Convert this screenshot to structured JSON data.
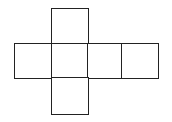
{
  "diagram": {
    "type": "cube-net",
    "stroke_color": "#222222",
    "background": "#ffffff",
    "squares": [
      {
        "id": "top",
        "row": 0,
        "col": 1
      },
      {
        "id": "left",
        "row": 1,
        "col": 0
      },
      {
        "id": "center",
        "row": 1,
        "col": 1
      },
      {
        "id": "right-1",
        "row": 1,
        "col": 2
      },
      {
        "id": "right-2",
        "row": 1,
        "col": 3
      },
      {
        "id": "bottom",
        "row": 2,
        "col": 1
      }
    ]
  }
}
